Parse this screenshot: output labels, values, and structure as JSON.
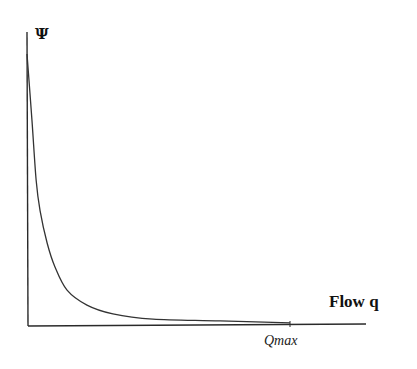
{
  "chart_data": {
    "type": "line",
    "title": "",
    "xlabel": "Flow q",
    "ylabel": "Ψ",
    "xlim": [
      0,
      1.29
    ],
    "ylim": [
      0,
      1.0
    ],
    "grid": false,
    "legend": "none",
    "x_ticks": [
      {
        "value": 1.0,
        "label": "Qmax"
      }
    ],
    "y_ticks": [],
    "series": [
      {
        "name": "Ψ(q)",
        "color": "#333333",
        "x": [
          0.0,
          0.015,
          0.031,
          0.046,
          0.073,
          0.103,
          0.149,
          0.225,
          0.324,
          0.477,
          0.733,
          1.0
        ],
        "y": [
          0.925,
          0.7,
          0.495,
          0.39,
          0.28,
          0.198,
          0.119,
          0.068,
          0.038,
          0.02,
          0.014,
          0.007
        ]
      }
    ]
  }
}
